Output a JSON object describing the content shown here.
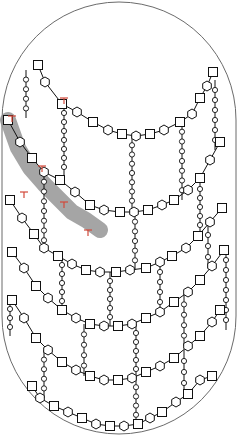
{
  "diagram": {
    "title": "",
    "colors": {
      "outline": "#6b6b6b",
      "strand": "#111111",
      "highlight": "#8f8f8f",
      "marker": "#d2483a",
      "background": "#ffffff"
    },
    "legend": {
      "square": "sugar-square",
      "hexagon": "sugar-hexagon",
      "small_circle": "peptide-residue",
      "red_t": "enzyme-marker"
    },
    "strands": [
      {
        "name": "strand-1",
        "points": [
          [
            38,
            65
          ],
          [
            45,
            82
          ],
          [
            62,
            104
          ],
          [
            77,
            112
          ],
          [
            93,
            122
          ],
          [
            108,
            130
          ],
          [
            122,
            134
          ],
          [
            136,
            136
          ],
          [
            150,
            134
          ],
          [
            164,
            130
          ],
          [
            180,
            122
          ],
          [
            192,
            114
          ],
          [
            200,
            98
          ],
          [
            207,
            86
          ],
          [
            213,
            72
          ]
        ]
      },
      {
        "name": "strand-2",
        "points": [
          [
            8,
            120
          ],
          [
            20,
            142
          ],
          [
            32,
            158
          ],
          [
            44,
            172
          ],
          [
            60,
            180
          ],
          [
            75,
            192
          ],
          [
            90,
            205
          ],
          [
            104,
            210
          ],
          [
            120,
            212
          ],
          [
            134,
            212
          ],
          [
            148,
            210
          ],
          [
            162,
            205
          ],
          [
            174,
            200
          ],
          [
            188,
            190
          ],
          [
            200,
            178
          ],
          [
            210,
            160
          ],
          [
            220,
            142
          ]
        ]
      },
      {
        "name": "strand-3",
        "points": [
          [
            10,
            200
          ],
          [
            22,
            218
          ],
          [
            34,
            234
          ],
          [
            44,
            248
          ],
          [
            58,
            256
          ],
          [
            72,
            264
          ],
          [
            86,
            270
          ],
          [
            100,
            272
          ],
          [
            116,
            272
          ],
          [
            130,
            270
          ],
          [
            146,
            268
          ],
          [
            160,
            262
          ],
          [
            172,
            256
          ],
          [
            186,
            248
          ],
          [
            198,
            236
          ],
          [
            210,
            222
          ],
          [
            222,
            208
          ]
        ]
      },
      {
        "name": "strand-4",
        "points": [
          [
            12,
            252
          ],
          [
            24,
            268
          ],
          [
            36,
            286
          ],
          [
            48,
            298
          ],
          [
            62,
            310
          ],
          [
            76,
            318
          ],
          [
            90,
            324
          ],
          [
            104,
            326
          ],
          [
            118,
            326
          ],
          [
            132,
            324
          ],
          [
            146,
            318
          ],
          [
            160,
            312
          ],
          [
            174,
            302
          ],
          [
            188,
            292
          ],
          [
            200,
            280
          ],
          [
            212,
            266
          ],
          [
            224,
            250
          ]
        ]
      },
      {
        "name": "strand-5",
        "points": [
          [
            12,
            300
          ],
          [
            24,
            318
          ],
          [
            36,
            338
          ],
          [
            48,
            350
          ],
          [
            62,
            362
          ],
          [
            76,
            370
          ],
          [
            90,
            376
          ],
          [
            104,
            380
          ],
          [
            118,
            380
          ],
          [
            132,
            378
          ],
          [
            146,
            372
          ],
          [
            160,
            366
          ],
          [
            174,
            358
          ],
          [
            188,
            346
          ],
          [
            200,
            336
          ],
          [
            212,
            322
          ],
          [
            220,
            310
          ]
        ]
      },
      {
        "name": "strand-6",
        "points": [
          [
            32,
            386
          ],
          [
            40,
            398
          ],
          [
            54,
            406
          ],
          [
            68,
            412
          ],
          [
            82,
            418
          ],
          [
            96,
            424
          ],
          [
            110,
            426
          ],
          [
            124,
            426
          ],
          [
            138,
            424
          ],
          [
            150,
            418
          ],
          [
            162,
            412
          ],
          [
            176,
            402
          ],
          [
            188,
            394
          ],
          [
            200,
            380
          ],
          [
            212,
            376
          ]
        ]
      }
    ],
    "highlighted_strand": {
      "name": "nascent-strand",
      "points": [
        [
          8,
          120
        ],
        [
          18,
          148
        ],
        [
          30,
          168
        ],
        [
          44,
          184
        ],
        [
          58,
          198
        ],
        [
          72,
          212
        ],
        [
          86,
          220
        ],
        [
          100,
          230
        ]
      ]
    },
    "crosslinks": [
      {
        "x": 26,
        "y1": 70,
        "y2": 118
      },
      {
        "x": 64,
        "y1": 104,
        "y2": 176
      },
      {
        "x": 132,
        "y1": 136,
        "y2": 210
      },
      {
        "x": 182,
        "y1": 122,
        "y2": 200
      },
      {
        "x": 215,
        "y1": 80,
        "y2": 150
      },
      {
        "x": 44,
        "y1": 172,
        "y2": 250
      },
      {
        "x": 135,
        "y1": 212,
        "y2": 270
      },
      {
        "x": 200,
        "y1": 180,
        "y2": 234
      },
      {
        "x": 62,
        "y1": 256,
        "y2": 310
      },
      {
        "x": 110,
        "y1": 272,
        "y2": 326
      },
      {
        "x": 160,
        "y1": 262,
        "y2": 312
      },
      {
        "x": 208,
        "y1": 224,
        "y2": 268
      },
      {
        "x": 84,
        "y1": 324,
        "y2": 376
      },
      {
        "x": 136,
        "y1": 324,
        "y2": 378
      },
      {
        "x": 184,
        "y1": 294,
        "y2": 346
      },
      {
        "x": 44,
        "y1": 350,
        "y2": 398
      },
      {
        "x": 136,
        "y1": 378,
        "y2": 424
      },
      {
        "x": 184,
        "y1": 350,
        "y2": 394
      },
      {
        "x": 10,
        "y1": 300,
        "y2": 336
      },
      {
        "x": 226,
        "y1": 250,
        "y2": 330
      }
    ],
    "markers": [
      [
        12,
        116
      ],
      [
        42,
        166
      ],
      [
        64,
        202
      ],
      [
        88,
        230
      ],
      [
        24,
        192
      ],
      [
        64,
        98
      ]
    ]
  }
}
